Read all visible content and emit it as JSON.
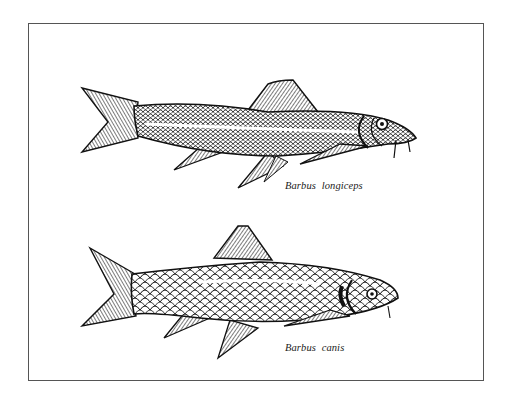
{
  "figure": {
    "species": [
      {
        "name": "Barbus longiceps",
        "position": "top"
      },
      {
        "name": "Barbus canis",
        "position": "bottom"
      }
    ]
  },
  "colors": {
    "ink": "#111111",
    "frame": "#555555",
    "background": "#ffffff"
  }
}
